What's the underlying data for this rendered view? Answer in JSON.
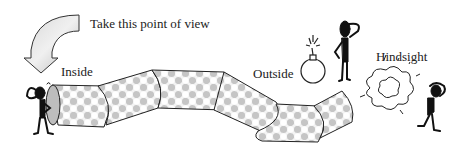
{
  "labels": {
    "take_pov": "Take this point of view",
    "inside": "Inside",
    "outside": "Outside",
    "hindsight": "Hindsight"
  },
  "elements": {
    "arrow": "curved-down-arrow",
    "tube": "segmented-checkered-tube",
    "figure_inside": "stick-figure-scratching-head",
    "figure_outside": "stick-figure-scratching-head",
    "figure_hindsight": "stick-figure-holding-head",
    "bomb": "bomb-with-lit-fuse",
    "explosion": "explosion-cloud"
  },
  "colors": {
    "outline": "#222222",
    "fill_light": "#f2f2f2",
    "fill_dark": "#bdbdbd",
    "figure": "#111111"
  }
}
